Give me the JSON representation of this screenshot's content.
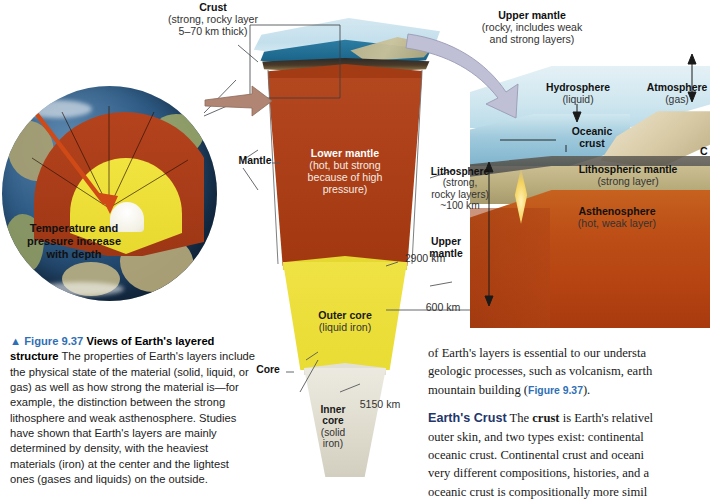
{
  "figure": {
    "number": "Figure 9.37",
    "title": "Views of Earth's layered",
    "title2": "structure",
    "caption_rest": " The properties of Earth's layers include the physical state of the material (solid, liquid, or gas) as well as how strong the material is—for example, the distinction between the strong lithosphere and weak asthenosphere. Studies have shown that Earth's layers are mainly determined by density, with the heaviest materials (iron) at the center and the lightest ones (gases and liquids) on the outside."
  },
  "globe": {
    "annotation": "Temperature and pressure increase with depth"
  },
  "wedge": {
    "crust": {
      "head": "Crust",
      "sub": "(strong, rocky layer\n5–70 km thick)"
    },
    "lower_mantle": {
      "head": "Lower mantle",
      "sub": "(hot, but strong\nbecause of high\npressure)"
    },
    "outer_core": {
      "head": "Outer core",
      "sub": "(liquid iron)"
    },
    "inner_core": {
      "head": "Inner\ncore",
      "sub": "(solid\niron)"
    },
    "bracket_mantle": "Mantle",
    "bracket_core": "Core",
    "depth_2900": "2900 km",
    "depth_5150": "5150 km"
  },
  "upper": {
    "upper_mantle_callout": {
      "head": "Upper mantle",
      "sub": "(rocky, includes weak\nand strong layers)"
    },
    "lithosphere": {
      "head": "Lithosphere",
      "sub": "(strong,\nrocky layers)\n~100 km"
    },
    "upper_mantle_label": "Upper\nmantle",
    "depth_600": "600 km"
  },
  "block": {
    "hydrosphere": {
      "head": "Hydrosphere",
      "sub": "(liquid)"
    },
    "atmosphere": {
      "head": "Atmosphere",
      "sub": "(gas)"
    },
    "oceanic_crust": {
      "head": "Oceanic\ncrust"
    },
    "lithospheric_mantle": {
      "head": "Lithospheric mantle",
      "sub": "(strong layer)"
    },
    "asthenosphere": {
      "head": "Asthenosphere",
      "sub": "(hot, weak layer)"
    },
    "continental_crust_clipped": "C"
  },
  "bodytext": {
    "p1_a": "of Earth's layers is essential to our understa",
    "p1_b": "geologic processes, such as volcanism, earth",
    "p1_c": "mountain building (",
    "p1_ref": "Figure 9.37",
    "p1_d": ").",
    "head": "Earth's Crust",
    "p2_a": "The ",
    "p2_bold": "crust",
    "p2_b": " is Earth's relativel",
    "p2_c": "outer skin, and two types exist: continental",
    "p2_d": "oceanic crust. Continental crust and oceani",
    "p2_e": "very different compositions, histories, and a",
    "p2_f": "oceanic crust is compositionally more simil"
  },
  "colors": {
    "mantle": "#b0441f",
    "outer_core": "#ede24a",
    "inner_core": "#e4e1d4",
    "asthenosphere": "#b84a14",
    "lithospheric_mantle": "#bdb083",
    "ocean": "#2e7fa3",
    "accent_blue": "#2f6fb5",
    "heading_navy": "#23356b"
  }
}
